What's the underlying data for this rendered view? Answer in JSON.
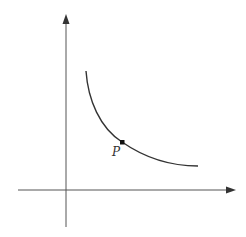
{
  "diagram": {
    "type": "decreasing convex curve on coordinate axes",
    "axes": {
      "origin": [
        66,
        190
      ],
      "x_axis": {
        "from": [
          18,
          190
        ],
        "to": [
          235,
          190
        ],
        "arrow": true,
        "label": ""
      },
      "y_axis": {
        "from": [
          66,
          227
        ],
        "to": [
          66,
          14
        ],
        "arrow": true,
        "label": ""
      }
    },
    "curve": {
      "start": [
        86,
        71
      ],
      "end": [
        198,
        166
      ],
      "shape": "convex decreasing (hyperbola-like)"
    },
    "point": {
      "label": "P",
      "position": [
        122,
        142
      ]
    },
    "colors": {
      "stroke": "#333333",
      "axis": "#555555",
      "background": "#ffffff"
    }
  }
}
